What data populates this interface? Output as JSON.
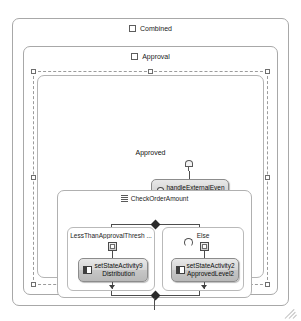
{
  "diagram": {
    "type": "workflow-state-machine-designer",
    "outer_state": {
      "label": "Combined",
      "icon": "state-icon"
    },
    "inner_state": {
      "label": "Approval",
      "icon": "state-icon"
    },
    "event_driven": {
      "label": "Approved",
      "selected": true,
      "handle_icon": "selection-handle"
    },
    "activities": [
      {
        "id": "handle-external-event",
        "icon": "event-icon",
        "line1": "handleExternalEven",
        "line2": "tActivity2"
      },
      {
        "id": "set-state-left",
        "icon": "set-state-icon",
        "line1": "setStateActivity9",
        "line2": "Distribution"
      },
      {
        "id": "set-state-right",
        "icon": "set-state-icon",
        "line1": "setStateActivity2",
        "line2": "ApprovedLevel2"
      }
    ],
    "ifelse": {
      "label": "CheckOrderAmount",
      "icon": "ifelse-icon",
      "branches": [
        {
          "id": "branch-left",
          "label": "LessThanApprovalThresh ...",
          "icon": "condition-icon"
        },
        {
          "id": "branch-right",
          "label": "Else",
          "icon": "condition-icon"
        }
      ]
    },
    "grip": {
      "name": "resize-grip"
    }
  }
}
